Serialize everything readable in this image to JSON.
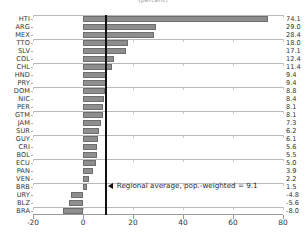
{
  "chart_data": {
    "type": "bar",
    "orientation": "horizontal",
    "title": "(percent)",
    "xlabel": "",
    "ylabel": "",
    "xlim": [
      -20,
      80
    ],
    "xticks": [
      -20,
      0,
      20,
      40,
      60,
      80
    ],
    "xtick_labels": [
      "-20",
      "0",
      "20",
      "40",
      "60",
      "80"
    ],
    "grid": true,
    "legend": "none",
    "categories": [
      "HTI",
      "ARG",
      "MEX",
      "TTO",
      "SLV",
      "COL",
      "CHL",
      "HND",
      "PRY",
      "DOM",
      "NIC",
      "PER",
      "GTM",
      "JAM",
      "SUR",
      "GUY",
      "CRI",
      "BOL",
      "ECU",
      "PAN",
      "VEN",
      "BRB",
      "URY",
      "BLZ",
      "BRA"
    ],
    "values": [
      74.1,
      29.0,
      28.4,
      18.0,
      17.1,
      12.4,
      11.4,
      9.4,
      9.4,
      8.8,
      8.4,
      8.1,
      8.1,
      7.3,
      6.2,
      6.1,
      5.6,
      5.5,
      5.0,
      3.9,
      2.2,
      1.5,
      -4.8,
      -5.6,
      -8.0
    ],
    "value_labels": [
      "74.1",
      "29.0",
      "28.4",
      "18.0",
      "17.1",
      "12.4",
      "11.4",
      "9.4",
      "9.4",
      "8.8",
      "8.4",
      "8.1",
      "8.1",
      "7.3",
      "6.2",
      "6.1",
      "5.6",
      "5.5",
      "5.0",
      "3.9",
      "2.2",
      "1.5",
      "-4.8",
      "-5.6",
      "-8.0"
    ],
    "annotations": [
      {
        "name": "regional-average-line",
        "text": "Regional average, pop.-weighted = 9.1",
        "value": 9.1,
        "marker": "left-arrow",
        "line_color": "#111111"
      }
    ],
    "colors": {
      "bar_fill": "#8e8e8e",
      "bar_edge": "#6e6e6e",
      "gridline": "#b9b9b9",
      "axis": "#9a9a9a",
      "annotation": "#111111",
      "text": "#333333"
    }
  }
}
